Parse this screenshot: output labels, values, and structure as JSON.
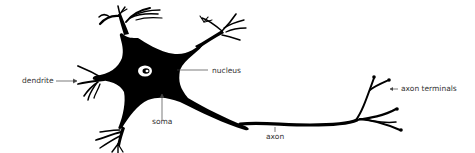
{
  "diagram": {
    "labels": {
      "dendrite": "dendrite",
      "nucleus": "nucleus",
      "soma": "soma",
      "axon": "axon",
      "axon_terminals": "axon terminals"
    },
    "colors": {
      "cell": "#000000",
      "label_text": "#333333",
      "leader_line": "#444444",
      "background": "#ffffff"
    }
  }
}
